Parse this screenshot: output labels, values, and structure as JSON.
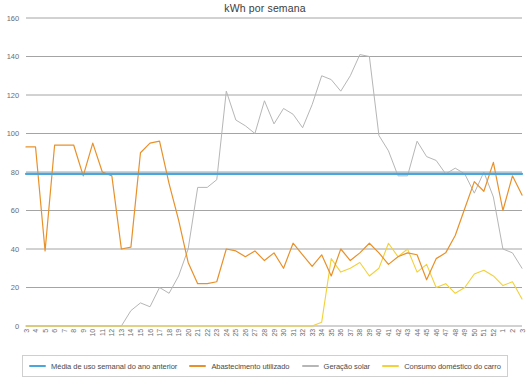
{
  "chart_data": {
    "type": "line",
    "title": "kWh por semana",
    "xlabel": "",
    "ylabel": "",
    "ylim": [
      0,
      160
    ],
    "yticks": [
      0,
      20,
      40,
      60,
      80,
      100,
      120,
      140,
      160
    ],
    "grid": true,
    "legend_position": "bottom",
    "categories": [
      "3",
      "4",
      "5",
      "6",
      "7",
      "8",
      "9",
      "10",
      "11",
      "12",
      "13",
      "14",
      "15",
      "16",
      "17",
      "18",
      "19",
      "20",
      "21",
      "22",
      "23",
      "24",
      "25",
      "26",
      "27",
      "28",
      "29",
      "30",
      "31",
      "32",
      "33",
      "34",
      "35",
      "36",
      "37",
      "38",
      "39",
      "40",
      "41",
      "42",
      "43",
      "44",
      "45",
      "46",
      "47",
      "48",
      "49",
      "50",
      "51",
      "52",
      "1",
      "2",
      "3"
    ],
    "series": [
      {
        "name": "Média de uso semanal do ano anterior",
        "color": "#4aa7de",
        "values": [
          79,
          79,
          79,
          79,
          79,
          79,
          79,
          79,
          79,
          79,
          79,
          79,
          79,
          79,
          79,
          79,
          79,
          79,
          79,
          79,
          79,
          79,
          79,
          79,
          79,
          79,
          79,
          79,
          79,
          79,
          79,
          79,
          79,
          79,
          79,
          79,
          79,
          79,
          79,
          79,
          79,
          79,
          79,
          79,
          79,
          79,
          79,
          79,
          79,
          79,
          79,
          79,
          79
        ]
      },
      {
        "name": "Abastecimento utilizado",
        "color": "#e8912a",
        "values": [
          93,
          93,
          39,
          94,
          94,
          94,
          78,
          95,
          80,
          78,
          40,
          41,
          90,
          95,
          96,
          74,
          55,
          33,
          22,
          22,
          23,
          40,
          39,
          36,
          39,
          34,
          38,
          30,
          43,
          37,
          31,
          37,
          26,
          40,
          34,
          38,
          43,
          38,
          32,
          36,
          38,
          37,
          24,
          35,
          38,
          0,
          0,
          0,
          0,
          0,
          0,
          0,
          0
        ]
      },
      {
        "name": "Geração solar",
        "color": "#b6b6b6",
        "values": [
          0,
          0,
          0,
          0,
          0,
          0,
          0,
          0,
          0,
          0,
          0,
          8,
          12,
          10,
          20,
          17,
          26,
          40,
          72,
          72,
          76,
          122,
          107,
          104,
          100,
          117,
          105,
          113,
          110,
          103,
          115,
          130,
          128,
          122,
          130,
          141,
          140,
          99,
          91,
          78,
          78,
          96,
          88,
          86,
          79,
          82,
          79,
          69,
          80,
          67,
          40,
          38,
          30
        ]
      },
      {
        "name": "Consumo doméstico do carro",
        "color": "#f2d13b",
        "values": [
          0,
          0,
          0,
          0,
          0,
          0,
          0,
          0,
          0,
          0,
          0,
          0,
          0,
          0,
          0,
          0,
          0,
          0,
          0,
          0,
          0,
          0,
          0,
          0,
          0,
          0,
          0,
          0,
          0,
          0,
          0,
          0,
          0,
          0,
          0,
          0,
          0,
          0,
          0,
          0,
          0,
          0,
          0,
          0,
          0,
          0,
          0,
          0,
          0,
          0,
          0,
          0,
          0
        ]
      }
    ],
    "series_detail": {
      "abastecimento": [
        93,
        93,
        39,
        94,
        94,
        94,
        78,
        95,
        80,
        78,
        40,
        41,
        90,
        95,
        96,
        74,
        55,
        33,
        22,
        22,
        23,
        40,
        39,
        36,
        39,
        34,
        38,
        30,
        43,
        37,
        31,
        37,
        26,
        40,
        34,
        38,
        43,
        38,
        32,
        36,
        38,
        37,
        24,
        35,
        38,
        47,
        61,
        75,
        70,
        85,
        60,
        78,
        68
      ],
      "geracao_solar": [
        0,
        0,
        0,
        0,
        0,
        0,
        0,
        0,
        0,
        0,
        0,
        8,
        12,
        10,
        20,
        17,
        26,
        40,
        72,
        72,
        76,
        122,
        107,
        104,
        100,
        117,
        105,
        113,
        110,
        103,
        115,
        130,
        128,
        122,
        130,
        141,
        140,
        99,
        91,
        78,
        78,
        96,
        88,
        86,
        79,
        82,
        79,
        69,
        80,
        67,
        40,
        38,
        30
      ],
      "consumo_carro": [
        0,
        0,
        0,
        0,
        0,
        0,
        0,
        0,
        0,
        0,
        0,
        0,
        0,
        0,
        0,
        0,
        0,
        0,
        0,
        0,
        0,
        0,
        0,
        0,
        0,
        0,
        0,
        0,
        0,
        0,
        0,
        2,
        35,
        28,
        30,
        33,
        26,
        30,
        43,
        36,
        40,
        28,
        32,
        20,
        22,
        17,
        20,
        27,
        29,
        26,
        21,
        23,
        14
      ]
    }
  },
  "legend": {
    "items": [
      {
        "label": "Média de uso semanal do ano anterior",
        "color": "#4aa7de"
      },
      {
        "label": "Abastecimento utilizado",
        "color": "#e8912a"
      },
      {
        "label": "Geração solar",
        "color": "#b6b6b6"
      },
      {
        "label": "Consumo doméstico do carro",
        "color": "#f2d13b"
      }
    ]
  }
}
